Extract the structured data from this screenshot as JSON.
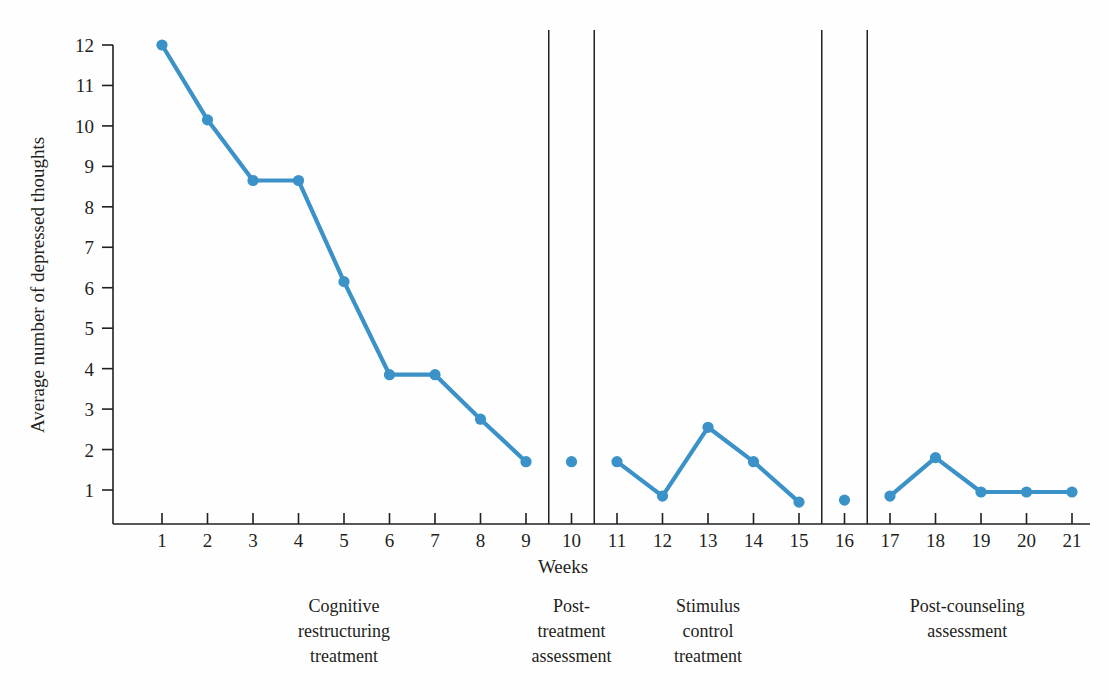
{
  "chart_data": {
    "type": "line",
    "title": "",
    "xlabel": "Weeks",
    "ylabel": "Average number of depressed thoughts",
    "xlim": [
      0.4,
      21.6
    ],
    "ylim": [
      0,
      12.4
    ],
    "grid": false,
    "legend": "none",
    "line_color": "#3b92c8",
    "marker_color": "#3b92c8",
    "axis_color": "#231f20",
    "x_ticks": [
      1,
      2,
      3,
      4,
      5,
      6,
      7,
      8,
      9,
      10,
      11,
      12,
      13,
      14,
      15,
      16,
      17,
      18,
      19,
      20,
      21
    ],
    "y_ticks": [
      1,
      2,
      3,
      4,
      5,
      6,
      7,
      8,
      9,
      10,
      11,
      12
    ],
    "x_tick_labels": [
      "1",
      "2",
      "3",
      "4",
      "5",
      "6",
      "7",
      "8",
      "9",
      "10",
      "11",
      "12",
      "13",
      "14",
      "15",
      "16",
      "17",
      "18",
      "19",
      "20",
      "21"
    ],
    "y_tick_labels": [
      "1",
      "2",
      "3",
      "4",
      "5",
      "6",
      "7",
      "8",
      "9",
      "10",
      "11",
      "12"
    ],
    "x": [
      1,
      2,
      3,
      4,
      5,
      6,
      7,
      8,
      9,
      10,
      11,
      12,
      13,
      14,
      15,
      16,
      17,
      18,
      19,
      20,
      21
    ],
    "values": [
      12.0,
      10.15,
      8.65,
      8.65,
      6.15,
      3.85,
      3.85,
      2.75,
      1.7,
      1.7,
      1.7,
      0.85,
      2.55,
      1.7,
      0.7,
      0.75,
      0.85,
      1.8,
      0.95,
      0.95,
      0.95
    ],
    "segments": [
      {
        "name": "cognitive-restructuring-treatment",
        "x": [
          1,
          2,
          3,
          4,
          5,
          6,
          7,
          8,
          9
        ],
        "values": [
          12.0,
          10.15,
          8.65,
          8.65,
          6.15,
          3.85,
          3.85,
          2.75,
          1.7
        ],
        "connected": true
      },
      {
        "name": "post-treatment-assessment",
        "x": [
          10
        ],
        "values": [
          1.7
        ],
        "connected": false
      },
      {
        "name": "stimulus-control-treatment",
        "x": [
          11,
          12,
          13,
          14,
          15
        ],
        "values": [
          1.7,
          0.85,
          2.55,
          1.7,
          0.7
        ],
        "connected": true
      },
      {
        "name": "post-counseling-assessment-point",
        "x": [
          16
        ],
        "values": [
          0.75
        ],
        "connected": false
      },
      {
        "name": "post-counseling-assessment",
        "x": [
          17,
          18,
          19,
          20,
          21
        ],
        "values": [
          0.85,
          1.8,
          0.95,
          0.95,
          0.95
        ],
        "connected": true
      }
    ],
    "dividers": [
      9.5,
      10.5,
      15.5,
      16.5
    ],
    "annotations": [
      {
        "name": "cognitive-restructuring-treatment",
        "lines": [
          "Cognitive",
          "restructuring",
          "treatment"
        ],
        "center_x": 5
      },
      {
        "name": "post-treatment-assessment",
        "lines": [
          "Post-",
          "treatment",
          "assessment"
        ],
        "center_x": 10
      },
      {
        "name": "stimulus-control-treatment",
        "lines": [
          "Stimulus",
          "control",
          "treatment"
        ],
        "center_x": 13
      },
      {
        "name": "post-counseling-assessment",
        "lines": [
          "Post-counseling",
          "assessment"
        ],
        "center_x": 18.7
      }
    ]
  }
}
